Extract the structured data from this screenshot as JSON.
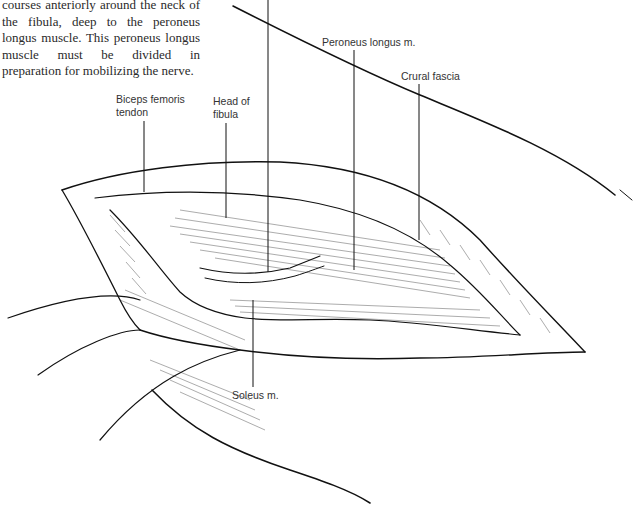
{
  "figure": {
    "caption_text": "courses anteriorly around the neck of the fibula, deep to the peroneus longus muscle. This peroneus longus muscle must be divided in preparation for mobilizing the nerve.",
    "labels": {
      "biceps_femoris": [
        "Biceps femoris",
        "tendon"
      ],
      "head_of_fibula": [
        "Head of",
        "fibula"
      ],
      "peroneus_longus": "Peroneus longus m.",
      "crural_fascia": "Crural fascia",
      "soleus": "Soleus m."
    },
    "colors": {
      "ink": "#111111",
      "text": "#333333",
      "background": "#ffffff"
    }
  }
}
